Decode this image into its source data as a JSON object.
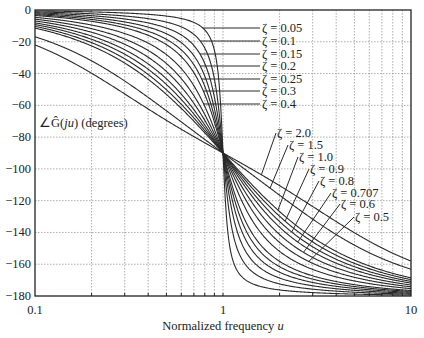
{
  "chart_data": {
    "type": "line",
    "title": "",
    "xlabel": "Normalized frequency u",
    "xlabel_text": "Normalized frequency ",
    "xlabel_var": "u",
    "ylabel": "∠Ĝ(ju) (degrees)",
    "ylabel_prefix": "∠Ĝ(",
    "ylabel_var": "ju",
    "ylabel_suffix": ") (degrees)",
    "xscale": "log",
    "xlim": [
      0.1,
      10
    ],
    "ylim": [
      -180,
      0
    ],
    "grid": true,
    "x_ticks": [
      "0.1",
      "1",
      "10"
    ],
    "y_ticks": [
      "0",
      "-20",
      "-40",
      "-60",
      "-80",
      "-100",
      "-120",
      "-140",
      "-160",
      "-180"
    ],
    "formula": "phase = -atan2(2*zeta*u, 1 - u^2)",
    "series": [
      {
        "name": "ζ = 0.05",
        "zeta": 0.05
      },
      {
        "name": "ζ = 0.1",
        "zeta": 0.1
      },
      {
        "name": "ζ = 0.15",
        "zeta": 0.15
      },
      {
        "name": "ζ = 0.2",
        "zeta": 0.2
      },
      {
        "name": "ζ = 0.25",
        "zeta": 0.25
      },
      {
        "name": "ζ = 0.3",
        "zeta": 0.3
      },
      {
        "name": "ζ = 0.4",
        "zeta": 0.4
      },
      {
        "name": "ζ = 0.5",
        "zeta": 0.5
      },
      {
        "name": "ζ = 0.6",
        "zeta": 0.6
      },
      {
        "name": "ζ = 0.707",
        "zeta": 0.707
      },
      {
        "name": "ζ = 0.8",
        "zeta": 0.8
      },
      {
        "name": "ζ = 0.9",
        "zeta": 0.9
      },
      {
        "name": "ζ = 1.0",
        "zeta": 1.0
      },
      {
        "name": "ζ = 1.5",
        "zeta": 1.5
      },
      {
        "name": "ζ = 2.0",
        "zeta": 2.0
      }
    ],
    "sample_points": {
      "u": [
        0.1,
        0.2,
        0.5,
        1,
        2,
        5,
        10
      ],
      "zeta_0.05_deg": [
        -0.6,
        -1.2,
        -3.8,
        -90,
        -176.2,
        -178.8,
        -179.4
      ],
      "zeta_0.5_deg": [
        -5.8,
        -11.8,
        -33.7,
        -90,
        -146.3,
        -168.2,
        -174.2
      ],
      "zeta_1.0_deg": [
        -11.4,
        -22.6,
        -53.1,
        -90,
        -126.9,
        -157.4,
        -168.6
      ],
      "zeta_2.0_deg": [
        -22.0,
        -39.8,
        -69.4,
        -90,
        -110.6,
        -140.2,
        -158.0
      ]
    },
    "annotations_upper": [
      {
        "text": "ζ = 0.05",
        "zeta": 0.05
      },
      {
        "text": "ζ = 0.1",
        "zeta": 0.1
      },
      {
        "text": "ζ = 0.15",
        "zeta": 0.15
      },
      {
        "text": "ζ = 0.2",
        "zeta": 0.2
      },
      {
        "text": "ζ = 0.25",
        "zeta": 0.25
      },
      {
        "text": "ζ = 0.3",
        "zeta": 0.3
      },
      {
        "text": "ζ = 0.4",
        "zeta": 0.4
      }
    ],
    "annotations_lower": [
      {
        "text": "ζ = 2.0",
        "zeta": 2.0
      },
      {
        "text": "ζ = 1.5",
        "zeta": 1.5
      },
      {
        "text": "ζ = 1.0",
        "zeta": 1.0
      },
      {
        "text": "ζ = 0.9",
        "zeta": 0.9
      },
      {
        "text": "ζ = 0.8",
        "zeta": 0.8
      },
      {
        "text": "ζ = 0.707",
        "zeta": 0.707
      },
      {
        "text": "ζ = 0.6",
        "zeta": 0.6
      },
      {
        "text": "ζ = 0.5",
        "zeta": 0.5
      }
    ]
  },
  "layout": {
    "plot_left": 35,
    "plot_right": 411,
    "plot_top": 10,
    "plot_bottom": 296,
    "upper_label_x": 262,
    "upper_label_y": [
      28,
      41,
      54,
      66,
      79,
      91,
      104
    ],
    "upper_leader_start_x": 205,
    "lower_label_pos": [
      [
        277,
        136
      ],
      [
        289,
        148
      ],
      [
        299,
        160
      ],
      [
        310,
        172
      ],
      [
        320,
        184
      ],
      [
        332,
        196
      ],
      [
        341,
        207
      ],
      [
        355,
        220
      ]
    ]
  },
  "colors": {
    "curve": "#2a2a2a",
    "grid": "#8a8a8a",
    "axis": "#222222",
    "background": "#ffffff"
  }
}
